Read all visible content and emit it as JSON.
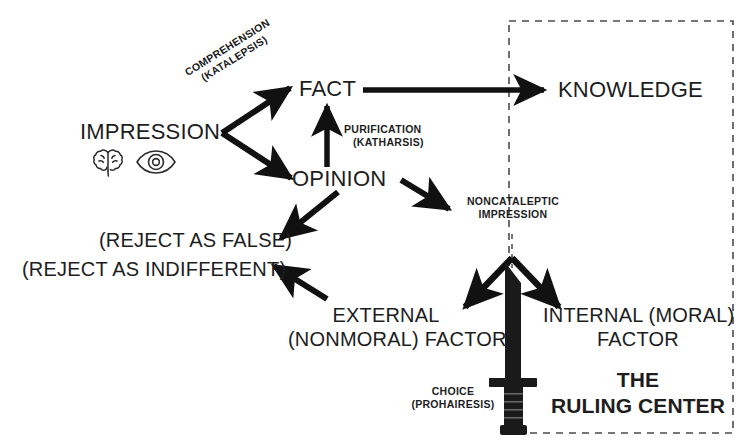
{
  "diagram": {
    "title_partial_cut_top": "",
    "nodes": {
      "impression": "IMPRESSION",
      "fact": "FACT",
      "opinion": "OPINION",
      "knowledge": "KNOWLEDGE",
      "reject_false": "(REJECT AS FALSE)",
      "reject_indifferent": "(REJECT AS INDIFFERENT)",
      "external_line1": "EXTERNAL",
      "external_line2": "(NONMORAL) FACTOR",
      "internal_line1": "INTERNAL (MORAL)",
      "internal_line2": "FACTOR",
      "ruling_center_line1": "THE",
      "ruling_center_line2": "RULING CENTER"
    },
    "edge_labels": {
      "comprehension_line1": "COMPREHENSION",
      "comprehension_line2": "(KATALEPSIS)",
      "purification_line1": "PURIFICATION",
      "purification_line2": "(KATHARSIS)",
      "noncataleptic_line1": "NONCATALEPTIC",
      "noncataleptic_line2": "IMPRESSION",
      "choice_line1": "CHOICE",
      "choice_line2": "(PROHAIRESIS)"
    },
    "icons": {
      "brain": "brain-icon",
      "eye": "eye-icon",
      "dagger": "dagger-icon"
    },
    "colors": {
      "ink": "#1d1d1d",
      "arrow": "#111111",
      "dashed_box": "#4a4a4a",
      "background": "#ffffff"
    }
  }
}
